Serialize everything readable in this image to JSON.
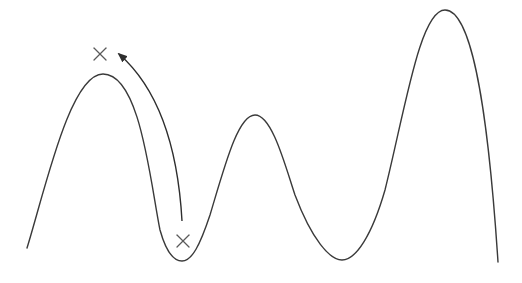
{
  "diagram": {
    "description": "Landscape curve with multiple peaks and valleys; an arrow shows a jump from a point in a valley to a point above the first peak",
    "colors": {
      "curve": "#3a3a3a",
      "marker": "#5a5a5a",
      "arrow": "#2e2e2e",
      "background": "#ffffff"
    },
    "curve_keypoints": [
      {
        "label": "start",
        "x": 27,
        "y": 248
      },
      {
        "label": "peak-1",
        "x": 103,
        "y": 74
      },
      {
        "label": "valley-1",
        "x": 182,
        "y": 261
      },
      {
        "label": "peak-2",
        "x": 255,
        "y": 115
      },
      {
        "label": "valley-2",
        "x": 342,
        "y": 260
      },
      {
        "label": "peak-3",
        "x": 445,
        "y": 10
      },
      {
        "label": "end",
        "x": 498,
        "y": 262
      }
    ],
    "markers": [
      {
        "name": "x-marker-start",
        "glyph": "×",
        "x": 183,
        "y": 241
      },
      {
        "name": "x-marker-target",
        "glyph": "×",
        "x": 100,
        "y": 54
      }
    ],
    "arrow": {
      "from": {
        "x": 182,
        "y": 221
      },
      "to": {
        "x": 119,
        "y": 54
      }
    },
    "text": ""
  }
}
